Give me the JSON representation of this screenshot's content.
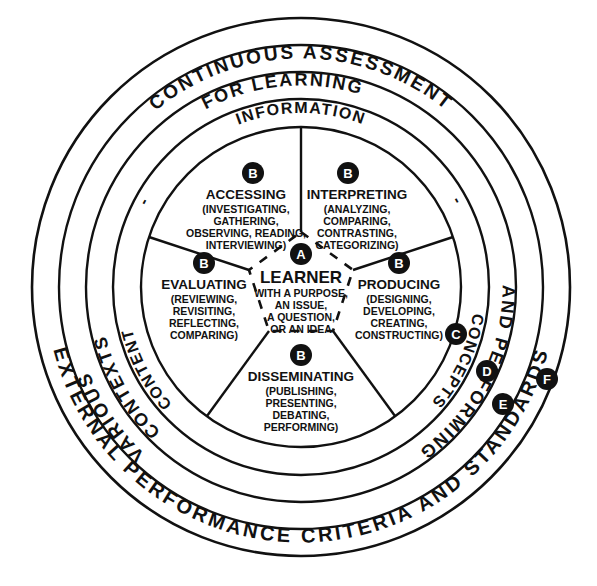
{
  "diagram": {
    "center": {
      "label": "LEARNER",
      "marker": "A",
      "lines": [
        "WITH A PURPOSE,",
        "AN ISSUE,",
        "A QUESTION,",
        "OR AN IDEA"
      ]
    },
    "colors": {
      "stroke": "#111111",
      "background": "#ffffff",
      "badge_fill": "#111111",
      "badge_text": "#ffffff"
    },
    "rings": [
      {
        "id": "ring-outer",
        "marker": "F",
        "label": "EXTERNAL PERFORMANCE CRITERIA AND STANDARDS",
        "top_label": "",
        "bottom_label": "EXTERNAL PERFORMANCE CRITERIA AND STANDARDS",
        "r_outer": 269,
        "r_inner": 242
      },
      {
        "id": "ring-2",
        "marker": "E",
        "top_label": "CONTINUOUS ASSESSMENT",
        "left_label": "VARIOUS",
        "right_label": "",
        "bottom_label": "",
        "r_outer": 242,
        "r_inner": 215
      },
      {
        "id": "ring-3",
        "marker": "D",
        "top_label": "FOR LEARNING",
        "left_label": "CONTEXTS",
        "right_label": "AND PERFORMING",
        "r_outer": 215,
        "r_inner": 188
      },
      {
        "id": "ring-4",
        "marker": "C",
        "top_label": "INFORMATION",
        "left_label": "CONTENT",
        "right_label": "CONCEPTS",
        "r_outer": 188,
        "r_inner": 160
      }
    ],
    "ring_separators": [
      "-",
      "-"
    ],
    "outer_ring_label": "EXTERNAL PERFORMANCE CRITERIA AND STANDARDS",
    "ring2_top_label": "CONTINUOUS ASSESSMENT",
    "ring2_left_label": "VARIOUS",
    "ring3_top_label": "FOR LEARNING",
    "ring3_left_label": "CONTEXTS",
    "ring3_right_label": "AND PERFORMING",
    "ring4_top_label": "INFORMATION",
    "ring4_left_label": "CONTENT",
    "ring4_right_label": "CONCEPTS",
    "markers": [
      {
        "letter": "A",
        "x": 301,
        "y": 253,
        "r": 11
      },
      {
        "letter": "C",
        "x": 456,
        "y": 334,
        "r": 11
      },
      {
        "letter": "D",
        "x": 487,
        "y": 371,
        "r": 11
      },
      {
        "letter": "E",
        "x": 503,
        "y": 404,
        "r": 11
      },
      {
        "letter": "F",
        "x": 546,
        "y": 379,
        "r": 11
      }
    ],
    "segments": [
      {
        "id": "segment-accessing",
        "marker": "B",
        "title": "ACCESSING",
        "lines": [
          "(INVESTIGATING,",
          "GATHERING,",
          "OBSERVING, READING,",
          "INTERVIEWING)"
        ],
        "badge": {
          "x": 253,
          "y": 173
        },
        "title_pos": {
          "x": 246,
          "y": 195
        },
        "lines_pos": {
          "x": 246,
          "y": 209
        }
      },
      {
        "id": "segment-interpreting",
        "marker": "B",
        "title": "INTERPRETING",
        "lines": [
          "(ANALYZING,",
          "COMPARING,",
          "CONTRASTING,",
          "CATEGORIZING)"
        ],
        "badge": {
          "x": 348,
          "y": 173
        },
        "title_pos": {
          "x": 354,
          "y": 195
        },
        "lines_pos": {
          "x": 354,
          "y": 209
        }
      },
      {
        "id": "segment-producing",
        "marker": "B",
        "title": "PRODUCING",
        "lines": [
          "(DESIGNING,",
          "DEVELOPING,",
          "CREATING,",
          "CONSTRUCTING)"
        ],
        "badge": {
          "x": 398,
          "y": 263
        },
        "title_pos": {
          "x": 398,
          "y": 285
        },
        "lines_pos": {
          "x": 398,
          "y": 299
        }
      },
      {
        "id": "segment-disseminating",
        "marker": "B",
        "title": "DISSEMINATING",
        "lines": [
          "(PUBLISHING,",
          "PRESENTING,",
          "DEBATING,",
          "PERFORMING)"
        ],
        "badge": {
          "x": 301,
          "y": 355
        },
        "title_pos": {
          "x": 301,
          "y": 377
        },
        "lines_pos": {
          "x": 301,
          "y": 391
        }
      },
      {
        "id": "segment-evaluating",
        "marker": "B",
        "title": "EVALUATING",
        "lines": [
          "(REVIEWING,",
          "REVISITING,",
          "REFLECTING,",
          "COMPARING)"
        ],
        "badge": {
          "x": 204,
          "y": 263
        },
        "title_pos": {
          "x": 204,
          "y": 285
        },
        "lines_pos": {
          "x": 204,
          "y": 299
        }
      }
    ]
  }
}
